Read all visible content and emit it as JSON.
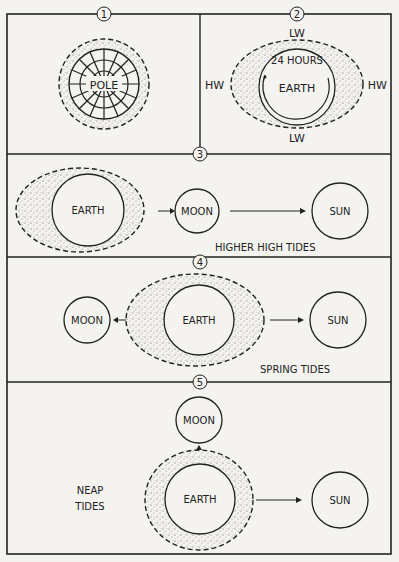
{
  "panels": [
    {
      "number": "1",
      "labels": {
        "center": "POLE"
      }
    },
    {
      "number": "2",
      "labels": {
        "top": "LW",
        "bottom": "LW",
        "left": "HW",
        "right": "HW",
        "arc": "24 HOURS",
        "center": "EARTH"
      }
    },
    {
      "number": "3",
      "labels": {
        "earth": "EARTH",
        "moon": "MOON",
        "sun": "SUN",
        "caption": "HIGHER HIGH TIDES"
      }
    },
    {
      "number": "4",
      "labels": {
        "earth": "EARTH",
        "moon": "MOON",
        "sun": "SUN",
        "caption": "SPRING TIDES"
      }
    },
    {
      "number": "5",
      "labels": {
        "earth": "EARTH",
        "moon": "MOON",
        "sun": "SUN",
        "caption_line1": "NEAP",
        "caption_line2": "TIDES"
      }
    }
  ],
  "colors": {
    "ink": "#222222",
    "paper": "#f4f3f0",
    "stipple": "#8a8a8a"
  }
}
